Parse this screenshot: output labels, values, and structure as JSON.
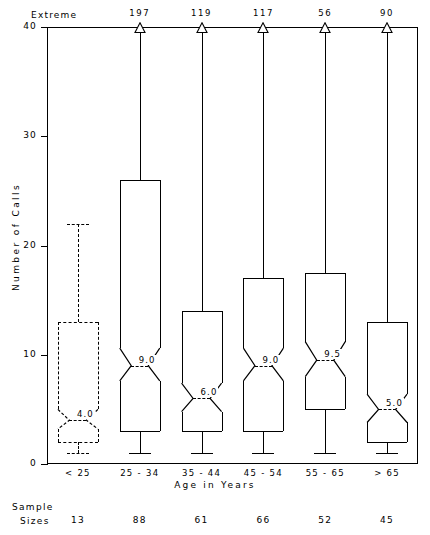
{
  "labels": {
    "extreme_header": "Extreme",
    "y_axis_title": "Number of Calls",
    "x_axis_title": "Age in Years",
    "sample_line1": "Sample",
    "sample_line2": "Sizes"
  },
  "chart_data": {
    "type": "box",
    "title": "",
    "xlabel": "Age in Years",
    "ylabel": "Number of Calls",
    "ylim": [
      0,
      40
    ],
    "yticks": [
      0,
      10,
      20,
      30,
      40
    ],
    "ytick_labels": [
      "0",
      "10",
      "20",
      "30",
      "40"
    ],
    "grid": false,
    "legend": "none",
    "notched": true,
    "categories": [
      "< 25",
      "25 - 34",
      "35 - 44",
      "45 - 54",
      "55 - 65",
      "> 65"
    ],
    "sample_sizes": [
      13,
      88,
      61,
      66,
      52,
      45
    ],
    "extremes": [
      "",
      "197",
      "119",
      "117",
      "56",
      "90"
    ],
    "median_labels": [
      "4.0",
      "9.0",
      "6.0",
      "9.0",
      "9.5",
      "5.0"
    ],
    "boxes": [
      {
        "category": "< 25",
        "n": 13,
        "whisker_low": 1.0,
        "q1": 2.0,
        "median": 4.0,
        "q3": 13.0,
        "whisker_high": 22.0,
        "extreme": null,
        "style": "dashed",
        "notch_low": 3.2,
        "notch_high": 5.0
      },
      {
        "category": "25 - 34",
        "n": 88,
        "whisker_low": 1.0,
        "q1": 3.0,
        "median": 9.0,
        "q3": 26.0,
        "whisker_high": 40.0,
        "extreme": 197,
        "style": "solid",
        "notch_low": 7.6,
        "notch_high": 10.6
      },
      {
        "category": "35 - 44",
        "n": 61,
        "whisker_low": 1.0,
        "q1": 3.0,
        "median": 6.0,
        "q3": 14.0,
        "whisker_high": 40.0,
        "extreme": 119,
        "style": "solid",
        "notch_low": 4.8,
        "notch_high": 7.4
      },
      {
        "category": "45 - 54",
        "n": 66,
        "whisker_low": 1.0,
        "q1": 3.0,
        "median": 9.0,
        "q3": 17.0,
        "whisker_high": 40.0,
        "extreme": 117,
        "style": "solid",
        "notch_low": 7.6,
        "notch_high": 10.6
      },
      {
        "category": "55 - 65",
        "n": 52,
        "whisker_low": 1.0,
        "q1": 5.0,
        "median": 9.5,
        "q3": 17.5,
        "whisker_high": 40.0,
        "extreme": 56,
        "style": "solid",
        "notch_low": 8.0,
        "notch_high": 11.2
      },
      {
        "category": "> 65",
        "n": 45,
        "whisker_low": 1.0,
        "q1": 2.0,
        "median": 5.0,
        "q3": 13.0,
        "whisker_high": 40.0,
        "extreme": 90,
        "style": "solid",
        "notch_low": 3.8,
        "notch_high": 6.4
      }
    ]
  }
}
